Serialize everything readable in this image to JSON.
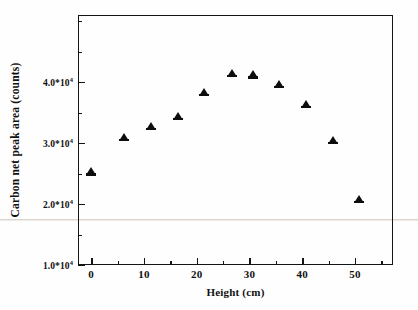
{
  "chart_data": {
    "type": "scatter",
    "title": "",
    "xlabel": "Height (cm)",
    "ylabel": "Carbon net peak area (counts)",
    "xlim": [
      -2.5,
      57.2
    ],
    "ylim": [
      10000,
      51000
    ],
    "grid": false,
    "legend": null,
    "marker": "filled-triangle",
    "marker_color": "#0d0d0d",
    "x_ticks": [
      {
        "value": 0,
        "label": "0",
        "major": true
      },
      {
        "value": 5,
        "label": "",
        "major": false
      },
      {
        "value": 10,
        "label": "10",
        "major": true
      },
      {
        "value": 15,
        "label": "",
        "major": false
      },
      {
        "value": 20,
        "label": "20",
        "major": true
      },
      {
        "value": 25,
        "label": "",
        "major": false
      },
      {
        "value": 30,
        "label": "30",
        "major": true
      },
      {
        "value": 35,
        "label": "",
        "major": false
      },
      {
        "value": 40,
        "label": "40",
        "major": true
      },
      {
        "value": 45,
        "label": "",
        "major": false
      },
      {
        "value": 50,
        "label": "50",
        "major": true
      },
      {
        "value": 55,
        "label": "",
        "major": false
      }
    ],
    "y_ticks": [
      {
        "value": 10000,
        "label": "1.0*10",
        "exp": "4",
        "major": true
      },
      {
        "value": 15000,
        "label": "",
        "exp": "",
        "major": false
      },
      {
        "value": 20000,
        "label": "2.0*10",
        "exp": "4",
        "major": true
      },
      {
        "value": 25000,
        "label": "",
        "exp": "",
        "major": false
      },
      {
        "value": 30000,
        "label": "3.0*10",
        "exp": "4",
        "major": true
      },
      {
        "value": 35000,
        "label": "",
        "exp": "",
        "major": false
      },
      {
        "value": 40000,
        "label": "4.0*10",
        "exp": "4",
        "major": true
      },
      {
        "value": 45000,
        "label": "",
        "exp": "",
        "major": false
      },
      {
        "value": 50000,
        "label": "",
        "exp": "",
        "major": false
      }
    ],
    "x": [
      0.0,
      6.3,
      11.4,
      16.4,
      21.4,
      26.6,
      30.6,
      35.6,
      40.7,
      45.8,
      50.7
    ],
    "y": [
      25200,
      30800,
      32700,
      34300,
      38200,
      41300,
      41100,
      39600,
      36200,
      30300,
      20700
    ],
    "points": [
      {
        "x": 0.0,
        "y": 25200
      },
      {
        "x": 6.3,
        "y": 30800
      },
      {
        "x": 11.4,
        "y": 32700
      },
      {
        "x": 16.4,
        "y": 34300
      },
      {
        "x": 21.4,
        "y": 38200
      },
      {
        "x": 26.6,
        "y": 41300
      },
      {
        "x": 30.6,
        "y": 41100
      },
      {
        "x": 35.6,
        "y": 39600
      },
      {
        "x": 40.7,
        "y": 36200
      },
      {
        "x": 45.8,
        "y": 30300
      },
      {
        "x": 50.7,
        "y": 20700
      }
    ]
  },
  "figure": {
    "background_color": "#ffffff",
    "axis_color": "#141414"
  }
}
